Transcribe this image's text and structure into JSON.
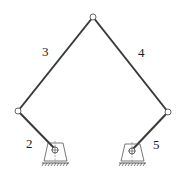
{
  "diagram": {
    "type": "five-bar linkage mechanism",
    "links": [
      {
        "id": "2",
        "label": "2"
      },
      {
        "id": "3",
        "label": "3"
      },
      {
        "id": "4",
        "label": "4"
      },
      {
        "id": "5",
        "label": "5"
      }
    ],
    "colors": {
      "link": "#3a3a3a",
      "joint_fill": "#ffffff",
      "joint_stroke": "#555555",
      "ground": "#444444"
    }
  }
}
